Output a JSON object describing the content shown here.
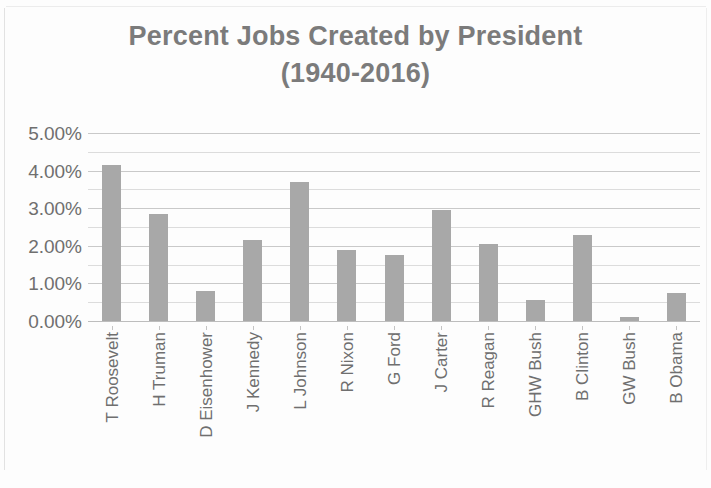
{
  "chart_data": {
    "type": "bar",
    "title": "Percent Jobs Created by President (1940-2016)",
    "title_lines": [
      "Percent Jobs Created by President",
      "(1940-2016)"
    ],
    "xlabel": "",
    "ylabel": "",
    "categories": [
      "T Roosevelt",
      "H Truman",
      "D Eisenhower",
      "J Kennedy",
      "L Johnson",
      "R Nixon",
      "G Ford",
      "J Carter",
      "R Reagan",
      "GHW Bush",
      "B Clinton",
      "GW Bush",
      "B Obama"
    ],
    "values": [
      4.15,
      2.85,
      0.8,
      2.15,
      3.7,
      1.9,
      1.75,
      2.95,
      2.05,
      0.55,
      2.3,
      0.1,
      0.75
    ],
    "ylim": [
      0,
      5
    ],
    "y_ticks": [
      0,
      1,
      2,
      3,
      4,
      5
    ],
    "y_tick_labels": [
      "0.00%",
      "1.00%",
      "2.00%",
      "3.00%",
      "4.00%",
      "5.00%"
    ],
    "minor_tick_step": 0.5,
    "grid": true,
    "grid_axis": "y",
    "legend": false,
    "bar_color": "#a8a8a8",
    "gridline_color": "#c9c9c9",
    "minor_gridline_color": "#dcdcdc",
    "text_color": "#6f6f6f",
    "title_color": "#7b7b7b",
    "background_color": "#fdfdfd"
  }
}
